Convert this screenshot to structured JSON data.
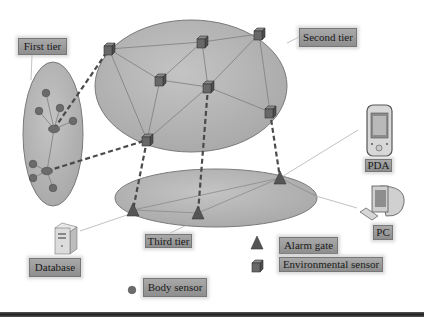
{
  "diagram": {
    "type": "body-area-network-tiers",
    "tiers": [
      {
        "id": "first",
        "label": "First tier"
      },
      {
        "id": "second",
        "label": "Second tier"
      },
      {
        "id": "third",
        "label": "Third tier"
      }
    ],
    "endpoints": [
      {
        "id": "database",
        "label": "Database"
      },
      {
        "id": "pda",
        "label": "PDA"
      },
      {
        "id": "pc",
        "label": "PC"
      }
    ],
    "legend": [
      {
        "symbol": "triangle",
        "label": "Alarm gate"
      },
      {
        "symbol": "cube",
        "label": "Environmental sensor"
      },
      {
        "symbol": "circle",
        "label": "Body sensor"
      }
    ],
    "colors": {
      "ellipse_fill": "#b0b0b0",
      "ellipse_stroke": "#7a7a7a",
      "node_fill": "#6a6a6a",
      "label_fill": "#9c9c9c",
      "dashed_link": "#4a4a4a"
    }
  }
}
